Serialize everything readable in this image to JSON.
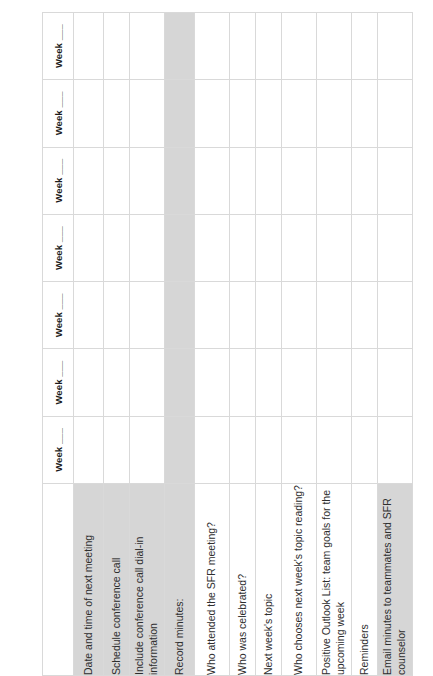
{
  "document": {
    "orientation": "rotated-90",
    "colors": {
      "shade": "#d6d6d6",
      "grid_line": "#d9d9d9",
      "text": "#2e2e2e",
      "header_text": "#1b1b1b",
      "page_background": "#ffffff"
    }
  },
  "table": {
    "column_headers": [
      {
        "label": "Week ___"
      },
      {
        "label": "Week ___"
      },
      {
        "label": "Week ___"
      },
      {
        "label": "Week ___"
      },
      {
        "label": "Week ___"
      },
      {
        "label": "Week ___"
      },
      {
        "label": "Week ___"
      }
    ],
    "week_column_count": 7,
    "rows": [
      {
        "label": "Date and time of next meeting",
        "label_shaded": true,
        "row_shaded": false,
        "height": "tall"
      },
      {
        "label": "Schedule conference call",
        "label_shaded": true,
        "row_shaded": false,
        "height": "short"
      },
      {
        "label": "Include conference call dial-in information",
        "label_shaded": true,
        "row_shaded": false,
        "height": "tall2"
      },
      {
        "label": "Record minutes:",
        "label_shaded": true,
        "row_shaded": true,
        "height": "tall"
      },
      {
        "label": "Who attended the SFR meeting?",
        "label_shaded": false,
        "row_shaded": false,
        "height": "tall2"
      },
      {
        "label": "Who was celebrated?",
        "label_shaded": false,
        "row_shaded": false,
        "height": "short"
      },
      {
        "label": "Next week's topic",
        "label_shaded": false,
        "row_shaded": false,
        "height": "short"
      },
      {
        "label": "Who chooses next week's topic reading?",
        "label_shaded": false,
        "row_shaded": false,
        "height": "tall2"
      },
      {
        "label": "Positive Outlook List: team goals for the upcoming week",
        "label_shaded": false,
        "row_shaded": false,
        "height": "tall2"
      },
      {
        "label": "Reminders",
        "label_shaded": false,
        "row_shaded": false,
        "height": "short"
      },
      {
        "label": "Email minutes to teammates and SFR counselor",
        "label_shaded": true,
        "row_shaded": false,
        "height": "tall2"
      }
    ]
  }
}
